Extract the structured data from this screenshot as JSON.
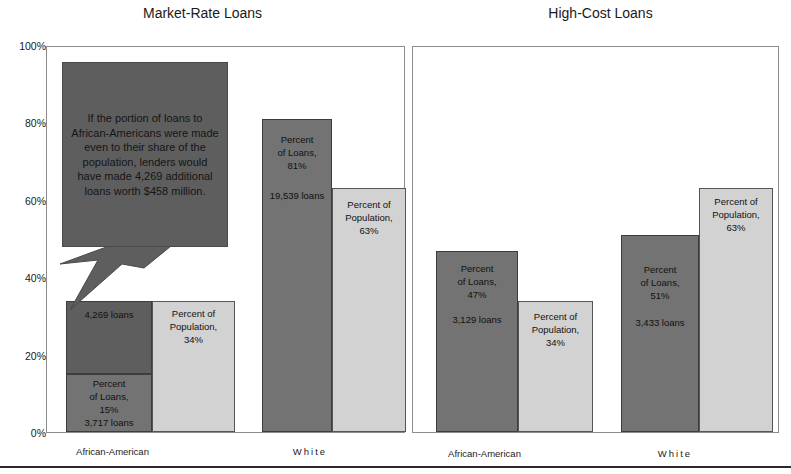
{
  "figure": {
    "bottom_rule": true,
    "axis": {
      "ylabel": "",
      "ymin": 0,
      "ymax": 100,
      "tick_labels": [
        "0%",
        "20%",
        "40%",
        "60%",
        "80%",
        "100%"
      ],
      "tick_values": [
        0,
        20,
        40,
        60,
        80,
        100
      ]
    },
    "colors": {
      "loans_bar": "#737373",
      "population_bar": "#d2d2d2",
      "ghost_bar": "#5e5e5e",
      "callout_fill": "#5e5e5e",
      "panel_border": "#8c8c8c",
      "text": "#111111"
    },
    "callout": {
      "text": "If the portion of loans to African-Americans were made even to their share of the population, lenders would have made 4,269 additional loans worth $458 million."
    }
  },
  "panels": {
    "left": {
      "title": "Market-Rate Loans",
      "categories": [
        "African-American",
        "White"
      ]
    },
    "right": {
      "title": "High-Cost Loans",
      "categories": [
        "African-American",
        "White"
      ]
    }
  },
  "chart_data": {
    "type": "bar",
    "xlabel": "",
    "ylabel": "",
    "ylim": [
      0,
      100
    ],
    "ytick_labels": [
      "0%",
      "20%",
      "40%",
      "60%",
      "80%",
      "100%"
    ],
    "grid": false,
    "legend": "none",
    "panels": [
      {
        "name": "Market-Rate Loans",
        "categories": [
          "African-American",
          "White"
        ],
        "series": [
          {
            "name": "Percent of Loans",
            "color": "#737373",
            "values": [
              15,
              81
            ],
            "labels": [
              "Percent\nof Loans,\n15%",
              "Percent\nof Loans,\n81%"
            ],
            "counts": [
              "3,717 loans",
              "19,539 loans"
            ]
          },
          {
            "name": "Percent of Population",
            "color": "#d2d2d2",
            "values": [
              34,
              63
            ],
            "labels": [
              "Percent of\nPopulation,\n34%",
              "Percent of\nPopulation,\n63%"
            ],
            "counts": [
              "",
              ""
            ]
          },
          {
            "name": "Shortfall (hypothetical additional loans)",
            "color": "#5e5e5e",
            "stacked_on": "Percent of Loans",
            "values": [
              19,
              0
            ],
            "labels": [
              "4,269 loans",
              ""
            ],
            "counts": [
              "4,269 loans",
              ""
            ]
          }
        ]
      },
      {
        "name": "High-Cost Loans",
        "categories": [
          "African-American",
          "White"
        ],
        "series": [
          {
            "name": "Percent of Loans",
            "color": "#737373",
            "values": [
              47,
              51
            ],
            "labels": [
              "Percent\nof Loans,\n47%",
              "Percent\nof Loans,\n51%"
            ],
            "counts": [
              "3,129 loans",
              "3,433 loans"
            ]
          },
          {
            "name": "Percent of Population",
            "color": "#d2d2d2",
            "values": [
              34,
              63
            ],
            "labels": [
              "Percent of\nPopulation,\n34%",
              "Percent of\nPopulation,\n63%"
            ],
            "counts": [
              "",
              ""
            ]
          }
        ]
      }
    ],
    "annotations": [
      {
        "text": "If the portion of loans to African-Americans were made even to their share of the population, lenders would have made 4,269 additional loans worth $458 million.",
        "points_to": "Market-Rate Loans / African-American / Percent of Loans"
      }
    ]
  },
  "labels": {
    "mr_aa_loans_main": "Percent\nof Loans,\n15%",
    "mr_aa_loans_count": "3,717 loans",
    "mr_aa_ghost_count": "4,269 loans",
    "mr_aa_pop": "Percent of\nPopulation,\n34%",
    "mr_w_loans_main": "Percent\nof Loans,\n81%",
    "mr_w_loans_count": "19,539 loans",
    "mr_w_pop": "Percent of\nPopulation,\n63%",
    "hc_aa_loans_main": "Percent\nof Loans,\n47%",
    "hc_aa_loans_count": "3,129 loans",
    "hc_aa_pop": "Percent of\nPopulation,\n34%",
    "hc_w_loans_main": "Percent\nof Loans,\n51%",
    "hc_w_loans_count": "3,433 loans",
    "hc_w_pop": "Percent of\nPopulation,\n63%"
  }
}
